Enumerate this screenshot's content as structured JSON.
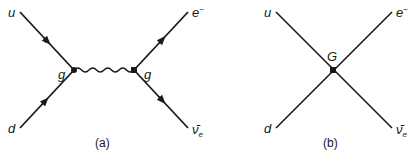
{
  "diagrams": [
    {
      "caption": "(a)",
      "description": "Feynman diagram: u and d quarks annihilate into a W boson (wavy line) which decays into e- and anti electron-neutrino",
      "vertex_labels": {
        "left": "g",
        "right": "g"
      },
      "particles": {
        "top_left": "u",
        "bottom_left": "d",
        "top_right_base": "e",
        "top_right_sup": "−",
        "bottom_right_base": "ν̄",
        "bottom_right_sub": "e"
      },
      "propagator": "wavy"
    },
    {
      "caption": "(b)",
      "description": "Four-fermion point interaction (Fermi contact) with coupling G",
      "vertex_labels": {
        "center": "G"
      },
      "particles": {
        "top_left": "u",
        "bottom_left": "d",
        "top_right_base": "e",
        "top_right_sup": "−",
        "bottom_right_base": "ν̄",
        "bottom_right_sub": "e"
      }
    }
  ],
  "colors": {
    "line": "#1a1a1a",
    "background": "#ffffff"
  }
}
